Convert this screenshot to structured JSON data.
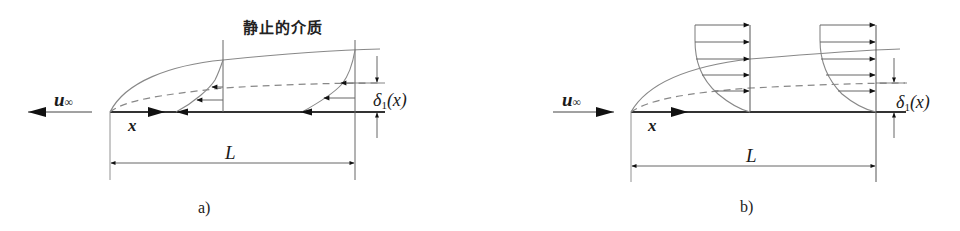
{
  "figure": {
    "colors": {
      "line": "#333333",
      "curve": "#888888",
      "arrow": "#111111"
    }
  },
  "panel_a": {
    "caption": "a)",
    "title": "静止的介质",
    "freestream_label": "u",
    "freestream_sub": "∞",
    "x_label": "x",
    "length_label": "L",
    "thickness_label": "δ",
    "thickness_sub": "1",
    "thickness_arg": "(x)",
    "freestream_direction": "left"
  },
  "panel_b": {
    "caption": "b)",
    "freestream_label": "u",
    "freestream_sub": "∞",
    "x_label": "x",
    "length_label": "L",
    "thickness_label": "δ",
    "thickness_sub": "1",
    "thickness_arg": "(x)",
    "freestream_direction": "right"
  }
}
